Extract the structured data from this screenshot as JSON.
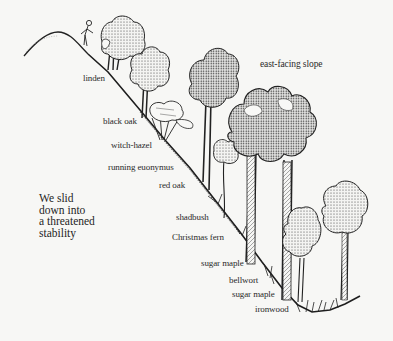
{
  "illustration": {
    "title": "east-facing slope",
    "caption_lines": [
      "We slid",
      "down into",
      "a threatened",
      "stability"
    ],
    "labels": [
      {
        "id": "linden",
        "text": "linden",
        "x": 83,
        "y": 73
      },
      {
        "id": "black-oak",
        "text": "black oak",
        "x": 103,
        "y": 116
      },
      {
        "id": "witch-hazel",
        "text": "witch-hazel",
        "x": 111,
        "y": 140
      },
      {
        "id": "running-euonymus",
        "text": "running euonymus",
        "x": 108,
        "y": 162
      },
      {
        "id": "red-oak",
        "text": "red oak",
        "x": 159,
        "y": 180
      },
      {
        "id": "shadbush",
        "text": "shadbush",
        "x": 176,
        "y": 212
      },
      {
        "id": "christmas-fern",
        "text": "Christmas fern",
        "x": 172,
        "y": 232
      },
      {
        "id": "sugar-maple-1",
        "text": "sugar maple",
        "x": 201,
        "y": 258
      },
      {
        "id": "bellwort",
        "text": "bellwort",
        "x": 229,
        "y": 275
      },
      {
        "id": "sugar-maple-2",
        "text": "sugar maple",
        "x": 232,
        "y": 289
      },
      {
        "id": "ironwood",
        "text": "ironwood",
        "x": 255,
        "y": 304
      }
    ]
  },
  "colors": {
    "background": "#f7f7f5",
    "ink": "#222222"
  }
}
